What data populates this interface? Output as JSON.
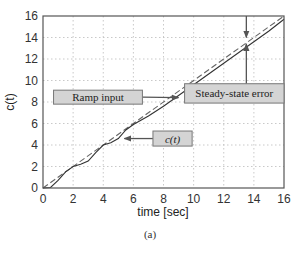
{
  "chart_data": {
    "type": "line",
    "title": "",
    "caption": "(a)",
    "xlabel": "time [sec]",
    "ylabel": "c(t)",
    "xlim": [
      0,
      16
    ],
    "ylim": [
      0,
      16
    ],
    "xticks": [
      0,
      2,
      4,
      6,
      8,
      10,
      12,
      14,
      16
    ],
    "yticks": [
      0,
      2,
      4,
      6,
      8,
      10,
      12,
      14,
      16
    ],
    "grid": true,
    "series": [
      {
        "name": "Ramp input",
        "style": "dashed",
        "color": "#666666",
        "x": [
          0,
          16
        ],
        "y": [
          0,
          16
        ]
      },
      {
        "name": "c(t)",
        "style": "solid",
        "color": "#333333",
        "x": [
          0,
          0.5,
          1,
          1.5,
          2,
          2.5,
          3,
          3.5,
          4,
          4.5,
          5,
          5.5,
          6,
          7,
          8,
          9,
          10,
          11,
          12,
          13,
          14,
          15,
          16
        ],
        "y": [
          0,
          0.05,
          0.7,
          1.5,
          2.0,
          2.2,
          2.5,
          3.3,
          4.0,
          4.2,
          4.6,
          5.4,
          5.9,
          6.7,
          7.6,
          8.6,
          9.6,
          10.6,
          11.6,
          12.6,
          13.6,
          14.6,
          15.7
        ]
      }
    ],
    "annotations": [
      {
        "text": "Ramp input",
        "box": [
          6.6,
          7.8,
          0.7,
          9.1
        ],
        "arrow_to": [
          9.0,
          8.4
        ]
      },
      {
        "text": "c(t)",
        "box": [
          7.3,
          3.9,
          9.9,
          5.3
        ],
        "arrow_from_x": 15.2,
        "arrow_to": [
          5.4,
          4.6
        ]
      },
      {
        "text": "Steady-state error",
        "box": [
          9.4,
          7.9,
          16.0,
          9.7
        ],
        "error_at_x": 13.5,
        "upper": 13.9,
        "lower": 13.5
      }
    ]
  }
}
